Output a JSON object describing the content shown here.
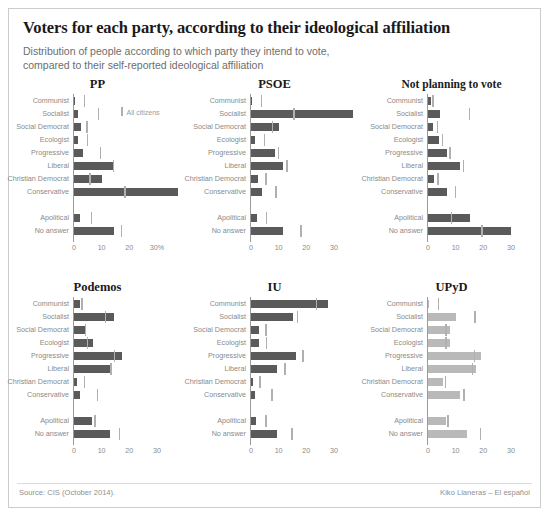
{
  "header": {
    "title": "Voters for each party, according to their ideological affiliation",
    "subtitle": "Distribution of people according to which party they intend to vote,\ncompared to their self-reported ideological affiliation"
  },
  "legend": {
    "label": "All citizens"
  },
  "footer": {
    "source": "Source: CIS (October 2014).",
    "credit": "Kiko Llaneras – El español"
  },
  "colors": {
    "bar_dark": "#5a5a5a",
    "bar_light": "#b9b9b9",
    "tick": "#b0b0b0",
    "axis": "#9a9a9a",
    "label": "#8a8a8a",
    "title": "#1a1a1a",
    "subtitle": "#6d6d6d",
    "frame": "#cccccc",
    "background": "#ffffff"
  },
  "chart_data": {
    "type": "bar",
    "title": "Voters for each party, according to their ideological affiliation",
    "subtitle": "Distribution of people according to which party they intend to vote, compared to their self-reported ideological affiliation",
    "xlabel": "",
    "ylabel": "",
    "xlim": [
      0,
      38
    ],
    "grid": false,
    "legend_position": "inside-top-left-panel",
    "legend_entries": [
      "All citizens"
    ],
    "orientation": "horizontal",
    "categories": [
      "Communist",
      "Socialist",
      "Social Democrat",
      "Ecologist",
      "Progressive",
      "Liberal",
      "Christian Democrat",
      "Conservative",
      "Apolitical",
      "No answer"
    ],
    "xticks_main": [
      0,
      10,
      20,
      30
    ],
    "xtick_labels_pp": [
      "0",
      "10",
      "20",
      "30%"
    ],
    "xtick_labels_other": [
      "0",
      "10",
      "20",
      "30"
    ],
    "panels": [
      {
        "name": "PP",
        "shade": "dark",
        "values": [
          0.4,
          1.6,
          2.4,
          1.5,
          3.3,
          14.6,
          10.2,
          37.5,
          2.3,
          14.3
        ],
        "reference": [
          3.6,
          8.6,
          4.5,
          4.6,
          9.3,
          14.0,
          5.6,
          18.2,
          6.1,
          17.0
        ]
      },
      {
        "name": "PSOE",
        "shade": "dark",
        "values": [
          0.5,
          37.0,
          10.3,
          1.6,
          8.6,
          11.6,
          2.4,
          3.9,
          2.0,
          11.5
        ],
        "reference": [
          3.6,
          15.2,
          7.5,
          4.6,
          9.6,
          12.8,
          5.1,
          8.8,
          5.4,
          17.8
        ]
      },
      {
        "name": "Not planning to vote",
        "shade": "dark",
        "values": [
          1.0,
          4.3,
          1.8,
          4.1,
          6.8,
          11.7,
          2.3,
          6.7,
          15.2,
          30.0
        ],
        "reference": [
          1.6,
          14.8,
          3.2,
          4.9,
          7.7,
          12.5,
          3.4,
          9.7,
          8.2,
          19.2
        ]
      },
      {
        "name": "Podemos",
        "shade": "dark",
        "values": [
          2.3,
          14.4,
          3.9,
          6.7,
          17.3,
          13.1,
          1.2,
          2.2,
          6.5,
          13.2
        ],
        "reference": [
          2.7,
          11.2,
          3.9,
          4.6,
          14.3,
          13.1,
          3.5,
          8.3,
          7.4,
          16.2
        ]
      },
      {
        "name": "IU",
        "shade": "dark",
        "values": [
          28.0,
          15.2,
          2.8,
          2.9,
          16.4,
          9.3,
          0.6,
          1.4,
          1.7,
          9.5
        ],
        "reference": [
          23.5,
          16.5,
          5.1,
          5.4,
          18.5,
          12.0,
          3.0,
          7.4,
          5.2,
          14.6
        ]
      },
      {
        "name": "UPyD",
        "shade": "light",
        "values": [
          0.2,
          10.2,
          8.0,
          8.0,
          19.0,
          17.2,
          5.6,
          11.5,
          6.5,
          14.0
        ],
        "reference": [
          3.6,
          16.8,
          6.2,
          6.3,
          16.6,
          15.9,
          6.0,
          12.8,
          7.0,
          18.8
        ]
      }
    ]
  }
}
